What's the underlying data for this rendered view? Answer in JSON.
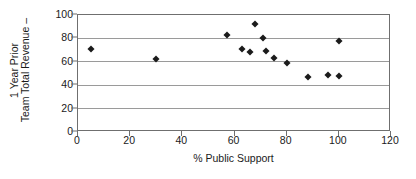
{
  "chart_data": {
    "type": "scatter",
    "title": "",
    "xlabel": "% Public Support",
    "ylabel": "Team Total Revenue – 1 Year Prior",
    "ylabel_lines": [
      "Team Total Revenue –",
      "1 Year Prior"
    ],
    "xlim": [
      0,
      120
    ],
    "ylim": [
      0,
      100
    ],
    "xticks": [
      0,
      20,
      40,
      60,
      80,
      100,
      120
    ],
    "yticks": [
      0,
      20,
      40,
      60,
      80,
      100
    ],
    "xtick_labels": [
      "0",
      "20",
      "40",
      "60",
      "80",
      "100",
      "120"
    ],
    "ytick_labels": [
      "0",
      "20",
      "40",
      "60",
      "80",
      "100"
    ],
    "grid": "horizontal",
    "legend": "none",
    "marker": "diamond",
    "marker_color": "#1b1b1b",
    "series": [
      {
        "name": "Teams",
        "points": [
          {
            "x": 5,
            "y": 71
          },
          {
            "x": 30,
            "y": 62
          },
          {
            "x": 57,
            "y": 83
          },
          {
            "x": 63,
            "y": 71
          },
          {
            "x": 66,
            "y": 68.5
          },
          {
            "x": 68,
            "y": 92
          },
          {
            "x": 71,
            "y": 80
          },
          {
            "x": 72,
            "y": 69.5
          },
          {
            "x": 75,
            "y": 63.5
          },
          {
            "x": 80,
            "y": 59
          },
          {
            "x": 88,
            "y": 47
          },
          {
            "x": 96,
            "y": 49
          },
          {
            "x": 100,
            "y": 47.5
          },
          {
            "x": 100,
            "y": 77.5
          }
        ]
      }
    ]
  },
  "colors": {
    "axis": "#6f6f6f",
    "grid": "#9a9a9a",
    "marker": "#1b1b1b",
    "text": "#1a1a1a",
    "background": "#ffffff"
  }
}
